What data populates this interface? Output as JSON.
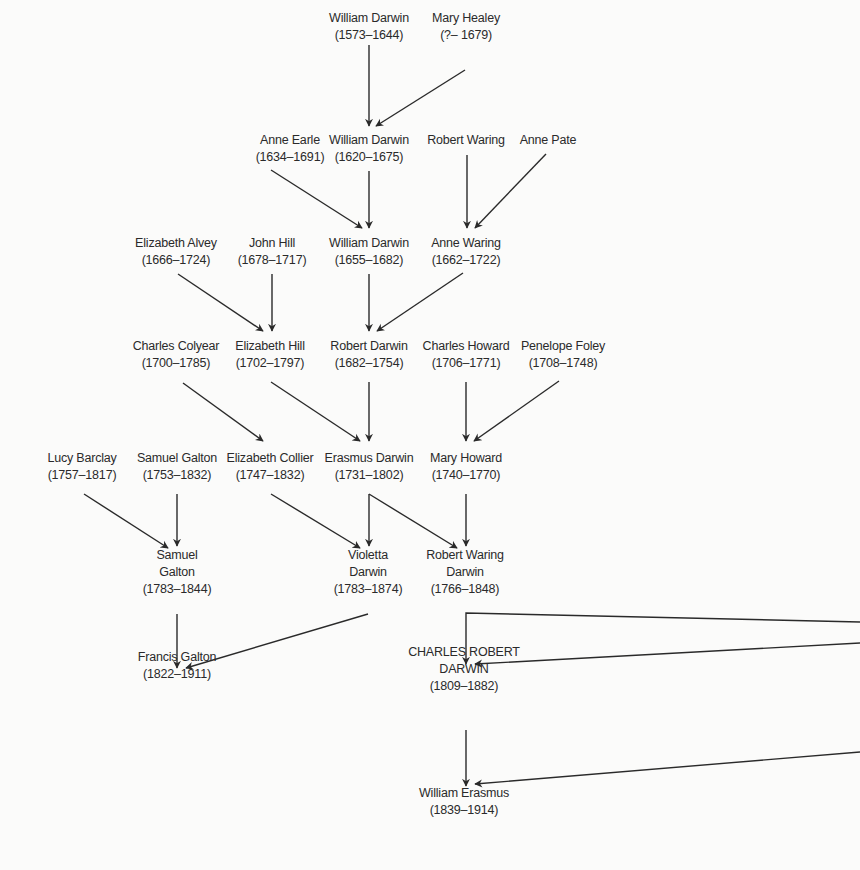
{
  "diagram": {
    "type": "family-tree",
    "line_color": "#2a2a2a",
    "background": "#fbfbfa",
    "nodes": [
      {
        "id": "wd1573",
        "lines": [
          "William Darwin",
          "(1573–1644)"
        ],
        "x": 369,
        "y": 10
      },
      {
        "id": "mh1679",
        "lines": [
          "Mary Healey",
          "(?– 1679)"
        ],
        "x": 466,
        "y": 10
      },
      {
        "id": "ae1634",
        "lines": [
          "Anne Earle",
          "(1634–1691)"
        ],
        "x": 290,
        "y": 132
      },
      {
        "id": "wd1620",
        "lines": [
          "William Darwin",
          "(1620–1675)"
        ],
        "x": 369,
        "y": 132
      },
      {
        "id": "rw",
        "lines": [
          "Robert Waring"
        ],
        "x": 466,
        "y": 132
      },
      {
        "id": "ap",
        "lines": [
          "Anne Pate"
        ],
        "x": 548,
        "y": 132
      },
      {
        "id": "ea1666",
        "lines": [
          "Elizabeth Alvey",
          "(1666–1724)"
        ],
        "x": 176,
        "y": 235
      },
      {
        "id": "jh1678",
        "lines": [
          "John Hill",
          "(1678–1717)"
        ],
        "x": 272,
        "y": 235
      },
      {
        "id": "wd1655",
        "lines": [
          "William Darwin",
          "(1655–1682)"
        ],
        "x": 369,
        "y": 235
      },
      {
        "id": "aw1662",
        "lines": [
          "Anne Waring",
          "(1662–1722)"
        ],
        "x": 466,
        "y": 235
      },
      {
        "id": "cc1700",
        "lines": [
          "Charles Colyear",
          "(1700–1785)"
        ],
        "x": 176,
        "y": 338
      },
      {
        "id": "eh1702",
        "lines": [
          "Elizabeth Hill",
          "(1702–1797)"
        ],
        "x": 270,
        "y": 338
      },
      {
        "id": "rd1682",
        "lines": [
          "Robert Darwin",
          "(1682–1754)"
        ],
        "x": 369,
        "y": 338
      },
      {
        "id": "ch1706",
        "lines": [
          "Charles Howard",
          "(1706–1771)"
        ],
        "x": 466,
        "y": 338
      },
      {
        "id": "pf1708",
        "lines": [
          "Penelope Foley",
          "(1708–1748)"
        ],
        "x": 563,
        "y": 338
      },
      {
        "id": "lb1757",
        "lines": [
          "Lucy Barclay",
          "(1757–1817)"
        ],
        "x": 82,
        "y": 450
      },
      {
        "id": "sg1753",
        "lines": [
          "Samuel Galton",
          "(1753–1832)"
        ],
        "x": 177,
        "y": 450
      },
      {
        "id": "ec1747",
        "lines": [
          "Elizabeth Collier",
          "(1747–1832)"
        ],
        "x": 270,
        "y": 450
      },
      {
        "id": "ed1731",
        "lines": [
          "Erasmus Darwin",
          "(1731–1802)"
        ],
        "x": 369,
        "y": 450
      },
      {
        "id": "mh1740",
        "lines": [
          "Mary Howard",
          "(1740–1770)"
        ],
        "x": 466,
        "y": 450
      },
      {
        "id": "sg1783",
        "lines": [
          "Samuel",
          "Galton",
          "(1783–1844)"
        ],
        "x": 177,
        "y": 547
      },
      {
        "id": "vd1783",
        "lines": [
          "Violetta",
          "Darwin",
          "(1783–1874)"
        ],
        "x": 368,
        "y": 547
      },
      {
        "id": "rwd1766",
        "lines": [
          "Robert Waring",
          "Darwin",
          "(1766–1848)"
        ],
        "x": 465,
        "y": 547
      },
      {
        "id": "fg1822",
        "lines": [
          "Francis Galton",
          "(1822–1911)"
        ],
        "x": 177,
        "y": 649
      },
      {
        "id": "crd1809",
        "lines": [
          "CHARLES ROBERT",
          "DARWIN",
          "(1809–1882)"
        ],
        "x": 464,
        "y": 644
      },
      {
        "id": "we1839",
        "lines": [
          "William Erasmus",
          "(1839–1914)"
        ],
        "x": 464,
        "y": 785
      }
    ],
    "arrows": [
      {
        "from": "wd1573",
        "to": "wd1620",
        "x1": 369,
        "y1": 45,
        "x2": 369,
        "y2": 126
      },
      {
        "from": "mh1679",
        "to": "wd1620",
        "x1": 465,
        "y1": 70,
        "x2": 376,
        "y2": 126
      },
      {
        "from": "ae1634",
        "to": "wd1655",
        "x1": 271,
        "y1": 170,
        "x2": 362,
        "y2": 228
      },
      {
        "from": "wd1620",
        "to": "wd1655",
        "x1": 369,
        "y1": 171,
        "x2": 369,
        "y2": 228
      },
      {
        "from": "rw",
        "to": "aw1662",
        "x1": 467,
        "y1": 155,
        "x2": 467,
        "y2": 228
      },
      {
        "from": "ap",
        "to": "aw1662",
        "x1": 546,
        "y1": 154,
        "x2": 475,
        "y2": 228
      },
      {
        "from": "ea1666",
        "to": "eh1702",
        "x1": 178,
        "y1": 274,
        "x2": 263,
        "y2": 331
      },
      {
        "from": "jh1678",
        "to": "eh1702",
        "x1": 272,
        "y1": 274,
        "x2": 272,
        "y2": 331
      },
      {
        "from": "wd1655",
        "to": "rd1682",
        "x1": 369,
        "y1": 274,
        "x2": 369,
        "y2": 331
      },
      {
        "from": "aw1662",
        "to": "rd1682",
        "x1": 463,
        "y1": 273,
        "x2": 377,
        "y2": 331
      },
      {
        "from": "cc1700",
        "to": "ec1747",
        "x1": 183,
        "y1": 383,
        "x2": 263,
        "y2": 441
      },
      {
        "from": "eh1702",
        "to": "ed1731",
        "x1": 271,
        "y1": 382,
        "x2": 360,
        "y2": 441
      },
      {
        "from": "rd1682",
        "to": "ed1731",
        "x1": 369,
        "y1": 382,
        "x2": 369,
        "y2": 441
      },
      {
        "from": "ch1706",
        "to": "mh1740",
        "x1": 466,
        "y1": 382,
        "x2": 466,
        "y2": 441
      },
      {
        "from": "pf1708",
        "to": "mh1740",
        "x1": 559,
        "y1": 381,
        "x2": 474,
        "y2": 441
      },
      {
        "from": "lb1757",
        "to": "sg1783",
        "x1": 84,
        "y1": 494,
        "x2": 168,
        "y2": 548
      },
      {
        "from": "sg1753",
        "to": "sg1783",
        "x1": 177,
        "y1": 494,
        "x2": 177,
        "y2": 546
      },
      {
        "from": "ec1747",
        "to": "vd1783",
        "x1": 271,
        "y1": 494,
        "x2": 360,
        "y2": 548
      },
      {
        "from": "ed1731",
        "to": "vd1783",
        "x1": 369,
        "y1": 494,
        "x2": 369,
        "y2": 546,
        "start_vertex": true
      },
      {
        "from": "ed1731",
        "to": "rwd1766",
        "x1": 369,
        "y1": 494,
        "x2": 457,
        "y2": 548
      },
      {
        "from": "mh1740",
        "to": "rwd1766",
        "x1": 466,
        "y1": 494,
        "x2": 466,
        "y2": 546
      },
      {
        "from": "sg1783",
        "to": "fg1822",
        "x1": 177,
        "y1": 614,
        "x2": 177,
        "y2": 668
      },
      {
        "from": "vd1783",
        "to": "fg1822",
        "x1": 368,
        "y1": 614,
        "x2": 186,
        "y2": 668
      },
      {
        "from": "rwd1766",
        "to": "crd1809",
        "path": "M 860 622 L 466 613 L 466 664",
        "polyline": true
      },
      {
        "from": "offpage",
        "to": "crd1809",
        "x1": 860,
        "y1": 643,
        "x2": 475,
        "y2": 664
      },
      {
        "from": "crd1809",
        "to": "we1839",
        "x1": 466,
        "y1": 730,
        "x2": 466,
        "y2": 786
      },
      {
        "from": "offpage",
        "to": "we1839",
        "x1": 860,
        "y1": 752,
        "x2": 475,
        "y2": 784
      }
    ]
  }
}
